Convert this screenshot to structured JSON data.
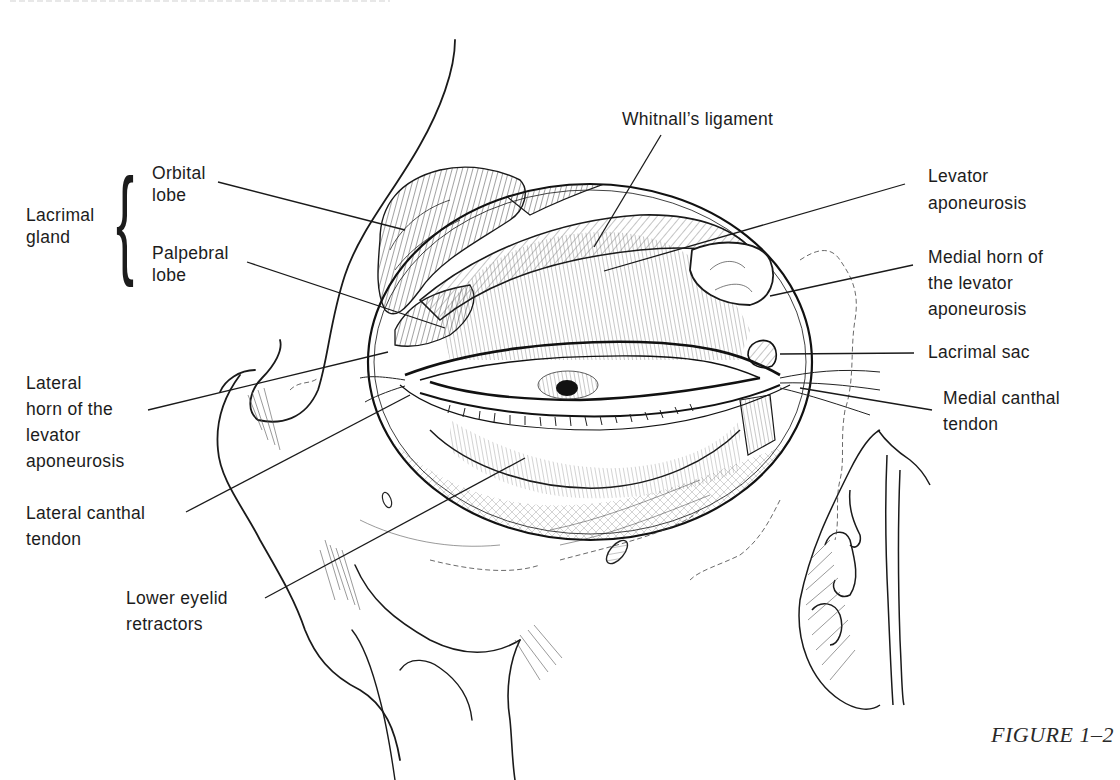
{
  "figure": {
    "caption": "FIGURE 1–2"
  },
  "labels": {
    "lacrimal_gland": {
      "lines": [
        "Lacrimal",
        "gland"
      ]
    },
    "orbital_lobe": {
      "lines": [
        "Orbital",
        "lobe"
      ]
    },
    "palpebral_lobe": {
      "lines": [
        "Palpebral",
        "lobe"
      ]
    },
    "lateral_horn": {
      "lines": [
        "Lateral",
        "horn of the",
        "levator",
        "aponeurosis"
      ]
    },
    "lateral_canthal_tendon": {
      "lines": [
        "Lateral canthal",
        "tendon"
      ]
    },
    "lower_eyelid_retractors": {
      "lines": [
        "Lower eyelid",
        "retractors"
      ]
    },
    "whitnalls_ligament": {
      "lines": [
        "Whitnall’s ligament"
      ]
    },
    "levator_aponeurosis": {
      "lines": [
        "Levator",
        "aponeurosis"
      ]
    },
    "medial_horn": {
      "lines": [
        "Medial horn of",
        "the levator",
        "aponeurosis"
      ]
    },
    "lacrimal_sac": {
      "lines": [
        "Lacrimal sac"
      ]
    },
    "medial_canthal_tendon": {
      "lines": [
        "Medial canthal",
        "tendon"
      ]
    }
  },
  "colors": {
    "ink": "#1a1a1a",
    "background": "#ffffff",
    "hatch": "#4a4a4a"
  }
}
